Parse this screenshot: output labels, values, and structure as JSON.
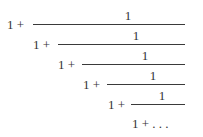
{
  "expression": {
    "description": "Infinite continued fraction",
    "levels": [
      {
        "prefix": "1 +",
        "numerator": "1"
      },
      {
        "prefix": "1 +",
        "numerator": "1"
      },
      {
        "prefix": "1 +",
        "numerator": "1"
      },
      {
        "prefix": "1 +",
        "numerator": "1"
      },
      {
        "prefix": "1 +",
        "numerator": "1"
      }
    ],
    "tail": "1 + . . ."
  },
  "colors": {
    "text": "#333333",
    "background": "#ffffff"
  }
}
